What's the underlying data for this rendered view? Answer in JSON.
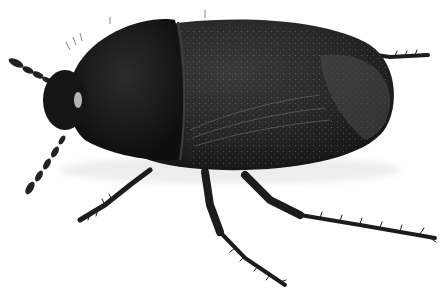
{
  "image": {
    "subject": "beetle",
    "description": "Dark grey/black water beetle with speckled elytra, shown in side-top view on white background",
    "colors": {
      "background": "#ffffff",
      "body_dark": "#1e1e1e",
      "body_mid": "#2e2e2e",
      "body_light": "#4a4a4a",
      "highlight": "#8a8a8a",
      "speckle": "#9a9a9a"
    }
  }
}
